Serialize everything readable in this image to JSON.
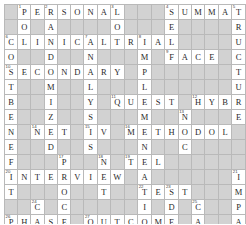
{
  "puzzle": {
    "type": "crossword-grid",
    "columns": 15,
    "rows": 15,
    "colors": {
      "empty_cell": "#d9d9d9",
      "letter_cell": "#ffffff",
      "grid_line": "#b9b9b9",
      "letter_text": "#2a2a2a",
      "number_text": "#3a3a3a"
    },
    "answers_across": [
      {
        "number": "1",
        "text": "PERSONAL",
        "row": 1,
        "col": 2
      },
      {
        "number": "4",
        "text": "SUMMAT",
        "row": 1,
        "col": 10
      },
      {
        "number": "6",
        "text": "CLINICALTRIAL",
        "row": 3,
        "col": 1
      },
      {
        "number": "7",
        "text": "FACE",
        "row": 4,
        "col": 11
      },
      {
        "number": "10",
        "text": "SECONDARY",
        "row": 5,
        "col": 1
      },
      {
        "number": "11",
        "text": "QUEST",
        "row": 7,
        "col": 8
      },
      {
        "number": "12",
        "text": "HYBR",
        "row": 7,
        "col": 12
      },
      {
        "number": "14",
        "text": "NET",
        "row": 9,
        "col": 3
      },
      {
        "number": "16",
        "text": "METHODOL",
        "row": 9,
        "col": 8
      },
      {
        "number": "18",
        "text": "TEL",
        "row": 11,
        "col": 10
      },
      {
        "number": "19",
        "text": "INTERVIEW",
        "row": 12,
        "col": 1
      },
      {
        "number": "22",
        "text": "TEST",
        "row": 13,
        "col": 10
      },
      {
        "number": "24",
        "text": "PHASE",
        "row": 15,
        "col": 1
      },
      {
        "number": "25",
        "text": "OUTCOME",
        "row": 15,
        "col": 7
      },
      {
        "number": "28",
        "text": "III",
        "row": 17,
        "col": 1
      },
      {
        "number": "29",
        "text": "SURVEY",
        "row": 17,
        "col": 5
      },
      {
        "number": "30",
        "text": "INDICAT",
        "row": 17,
        "col": 12
      }
    ],
    "grid": [
      [
        {
          "s": "block"
        },
        {
          "s": "open",
          "l": "P",
          "n": "1"
        },
        {
          "s": "open",
          "l": "E"
        },
        {
          "s": "open",
          "l": "R",
          "n": "2"
        },
        {
          "s": "open",
          "l": "S"
        },
        {
          "s": "open",
          "l": "O"
        },
        {
          "s": "open",
          "l": "N"
        },
        {
          "s": "open",
          "l": "A"
        },
        {
          "s": "open",
          "l": "L",
          "n": "3"
        },
        {
          "s": "block"
        },
        {
          "s": "block"
        },
        {
          "s": "block"
        },
        {
          "s": "open",
          "l": "S",
          "n": "4"
        },
        {
          "s": "open",
          "l": "U"
        },
        {
          "s": "open",
          "l": "M"
        },
        {
          "s": "open",
          "l": "M"
        },
        {
          "s": "open",
          "l": "A"
        },
        {
          "s": "open",
          "l": "T",
          "n": "5"
        }
      ],
      [
        {
          "s": "block"
        },
        {
          "s": "open",
          "l": "O"
        },
        {
          "s": "block"
        },
        {
          "s": "open",
          "l": "A"
        },
        {
          "s": "block"
        },
        {
          "s": "block"
        },
        {
          "s": "block"
        },
        {
          "s": "block"
        },
        {
          "s": "open",
          "l": "O"
        },
        {
          "s": "block"
        },
        {
          "s": "block"
        },
        {
          "s": "block"
        },
        {
          "s": "open",
          "l": "E"
        },
        {
          "s": "block"
        },
        {
          "s": "block"
        },
        {
          "s": "block"
        },
        {
          "s": "block"
        },
        {
          "s": "open",
          "l": "R"
        }
      ],
      [
        {
          "s": "open",
          "l": "C",
          "n": "6"
        },
        {
          "s": "open",
          "l": "L"
        },
        {
          "s": "open",
          "l": "I"
        },
        {
          "s": "open",
          "l": "N"
        },
        {
          "s": "open",
          "l": "I"
        },
        {
          "s": "open",
          "l": "C"
        },
        {
          "s": "open",
          "l": "A",
          "n": "7"
        },
        {
          "s": "open",
          "l": "L"
        },
        {
          "s": "open",
          "l": "T"
        },
        {
          "s": "open",
          "l": "R"
        },
        {
          "s": "open",
          "l": "I",
          "n": "8"
        },
        {
          "s": "open",
          "l": "A"
        },
        {
          "s": "open",
          "l": "L"
        },
        {
          "s": "block"
        },
        {
          "s": "block"
        },
        {
          "s": "block"
        },
        {
          "s": "block"
        },
        {
          "s": "open",
          "l": "U"
        }
      ],
      [
        {
          "s": "open",
          "l": "O"
        },
        {
          "s": "block"
        },
        {
          "s": "block"
        },
        {
          "s": "open",
          "l": "D"
        },
        {
          "s": "block"
        },
        {
          "s": "block"
        },
        {
          "s": "open",
          "l": "N"
        },
        {
          "s": "block"
        },
        {
          "s": "block"
        },
        {
          "s": "block"
        },
        {
          "s": "open",
          "l": "M"
        },
        {
          "s": "block"
        },
        {
          "s": "open",
          "l": "F",
          "n": "9"
        },
        {
          "s": "open",
          "l": "A"
        },
        {
          "s": "open",
          "l": "C"
        },
        {
          "s": "open",
          "l": "E"
        },
        {
          "s": "block"
        },
        {
          "s": "open",
          "l": "C"
        }
      ],
      [
        {
          "s": "open",
          "l": "S",
          "n": "10"
        },
        {
          "s": "open",
          "l": "E"
        },
        {
          "s": "open",
          "l": "C"
        },
        {
          "s": "open",
          "l": "O"
        },
        {
          "s": "open",
          "l": "N"
        },
        {
          "s": "open",
          "l": "D"
        },
        {
          "s": "open",
          "l": "A"
        },
        {
          "s": "open",
          "l": "R"
        },
        {
          "s": "open",
          "l": "Y"
        },
        {
          "s": "block"
        },
        {
          "s": "open",
          "l": "P"
        },
        {
          "s": "block"
        },
        {
          "s": "block"
        },
        {
          "s": "block"
        },
        {
          "s": "block"
        },
        {
          "s": "block"
        },
        {
          "s": "block"
        },
        {
          "s": "open",
          "l": "T"
        }
      ],
      [
        {
          "s": "open",
          "l": "T"
        },
        {
          "s": "block"
        },
        {
          "s": "block"
        },
        {
          "s": "open",
          "l": "M"
        },
        {
          "s": "block"
        },
        {
          "s": "block"
        },
        {
          "s": "open",
          "l": "L"
        },
        {
          "s": "block"
        },
        {
          "s": "block"
        },
        {
          "s": "block"
        },
        {
          "s": "open",
          "l": "L"
        },
        {
          "s": "block"
        },
        {
          "s": "block"
        },
        {
          "s": "block"
        },
        {
          "s": "block"
        },
        {
          "s": "block"
        },
        {
          "s": "block"
        },
        {
          "s": "open",
          "l": "U"
        }
      ],
      [
        {
          "s": "open",
          "l": "B"
        },
        {
          "s": "block"
        },
        {
          "s": "block"
        },
        {
          "s": "open",
          "l": "I"
        },
        {
          "s": "block"
        },
        {
          "s": "block"
        },
        {
          "s": "open",
          "l": "Y"
        },
        {
          "s": "block"
        },
        {
          "s": "open",
          "l": "Q",
          "n": "11"
        },
        {
          "s": "open",
          "l": "U"
        },
        {
          "s": "open",
          "l": "E"
        },
        {
          "s": "open",
          "l": "S"
        },
        {
          "s": "open",
          "l": "T"
        },
        {
          "s": "block"
        },
        {
          "s": "open",
          "l": "H",
          "n": "12"
        },
        {
          "s": "open",
          "l": "Y"
        },
        {
          "s": "open",
          "l": "B"
        },
        {
          "s": "open",
          "l": "R"
        }
      ],
      [
        {
          "s": "open",
          "l": "E"
        },
        {
          "s": "block"
        },
        {
          "s": "block"
        },
        {
          "s": "open",
          "l": "Z"
        },
        {
          "s": "block"
        },
        {
          "s": "block"
        },
        {
          "s": "open",
          "l": "S"
        },
        {
          "s": "block"
        },
        {
          "s": "block"
        },
        {
          "s": "block"
        },
        {
          "s": "open",
          "l": "M"
        },
        {
          "s": "block"
        },
        {
          "s": "block"
        },
        {
          "s": "open",
          "l": "N",
          "n": "13"
        },
        {
          "s": "block"
        },
        {
          "s": "block"
        },
        {
          "s": "block"
        },
        {
          "s": "open",
          "l": "E"
        }
      ],
      [
        {
          "s": "open",
          "l": "N"
        },
        {
          "s": "block"
        },
        {
          "s": "open",
          "l": "N",
          "n": "14"
        },
        {
          "s": "open",
          "l": "E"
        },
        {
          "s": "open",
          "l": "T"
        },
        {
          "s": "block"
        },
        {
          "s": "open",
          "l": "I",
          "n": "15"
        },
        {
          "s": "open",
          "l": "V"
        },
        {
          "s": "block"
        },
        {
          "s": "open",
          "l": "M",
          "n": "16"
        },
        {
          "s": "open",
          "l": "E"
        },
        {
          "s": "open",
          "l": "T"
        },
        {
          "s": "open",
          "l": "H"
        },
        {
          "s": "open",
          "l": "O"
        },
        {
          "s": "open",
          "l": "D"
        },
        {
          "s": "open",
          "l": "O"
        },
        {
          "s": "open",
          "l": "L"
        },
        {
          "s": "block"
        }
      ],
      [
        {
          "s": "open",
          "l": "E"
        },
        {
          "s": "block"
        },
        {
          "s": "block"
        },
        {
          "s": "open",
          "l": "D"
        },
        {
          "s": "block"
        },
        {
          "s": "block"
        },
        {
          "s": "open",
          "l": "S"
        },
        {
          "s": "block"
        },
        {
          "s": "block"
        },
        {
          "s": "block"
        },
        {
          "s": "open",
          "l": "N"
        },
        {
          "s": "block"
        },
        {
          "s": "block"
        },
        {
          "s": "open",
          "l": "C"
        },
        {
          "s": "block"
        },
        {
          "s": "block"
        },
        {
          "s": "block"
        },
        {
          "s": "block"
        }
      ],
      [
        {
          "s": "open",
          "l": "F"
        },
        {
          "s": "block"
        },
        {
          "s": "block"
        },
        {
          "s": "block"
        },
        {
          "s": "open",
          "l": "P",
          "n": "17"
        },
        {
          "s": "block"
        },
        {
          "s": "block"
        },
        {
          "s": "open",
          "l": "N",
          "n": "18"
        },
        {
          "s": "block"
        },
        {
          "s": "open",
          "l": "T",
          "n": "19"
        },
        {
          "s": "open",
          "l": "E"
        },
        {
          "s": "open",
          "l": "L"
        },
        {
          "s": "block"
        },
        {
          "s": "block"
        },
        {
          "s": "block"
        },
        {
          "s": "block"
        },
        {
          "s": "block"
        },
        {
          "s": "block"
        }
      ],
      [
        {
          "s": "open",
          "l": "I",
          "n": "20"
        },
        {
          "s": "open",
          "l": "N"
        },
        {
          "s": "open",
          "l": "T"
        },
        {
          "s": "open",
          "l": "E"
        },
        {
          "s": "open",
          "l": "R"
        },
        {
          "s": "open",
          "l": "V"
        },
        {
          "s": "open",
          "l": "I"
        },
        {
          "s": "open",
          "l": "E"
        },
        {
          "s": "open",
          "l": "W"
        },
        {
          "s": "block"
        },
        {
          "s": "open",
          "l": "A"
        },
        {
          "s": "block"
        },
        {
          "s": "block"
        },
        {
          "s": "block"
        },
        {
          "s": "block"
        },
        {
          "s": "block"
        },
        {
          "s": "block"
        },
        {
          "s": "open",
          "l": "I",
          "n": "21"
        }
      ],
      [
        {
          "s": "open",
          "l": "T"
        },
        {
          "s": "block"
        },
        {
          "s": "block"
        },
        {
          "s": "block"
        },
        {
          "s": "open",
          "l": "O"
        },
        {
          "s": "block"
        },
        {
          "s": "block"
        },
        {
          "s": "open",
          "l": "T"
        },
        {
          "s": "block"
        },
        {
          "s": "block"
        },
        {
          "s": "open",
          "l": "T",
          "n": "22"
        },
        {
          "s": "open",
          "l": "E"
        },
        {
          "s": "open",
          "l": "S",
          "n": "23"
        },
        {
          "s": "open",
          "l": "T"
        },
        {
          "s": "block"
        },
        {
          "s": "block"
        },
        {
          "s": "block"
        },
        {
          "s": "open",
          "l": "M"
        }
      ],
      [
        {
          "s": "block"
        },
        {
          "s": "block"
        },
        {
          "s": "open",
          "l": "C",
          "n": "24"
        },
        {
          "s": "block"
        },
        {
          "s": "open",
          "l": "C"
        },
        {
          "s": "block"
        },
        {
          "s": "block"
        },
        {
          "s": "block"
        },
        {
          "s": "block"
        },
        {
          "s": "block"
        },
        {
          "s": "open",
          "l": "I"
        },
        {
          "s": "block"
        },
        {
          "s": "open",
          "l": "D"
        },
        {
          "s": "block"
        },
        {
          "s": "open",
          "l": "C",
          "n": "25"
        },
        {
          "s": "block"
        },
        {
          "s": "block"
        },
        {
          "s": "open",
          "l": "P"
        }
      ],
      [
        {
          "s": "open",
          "l": "P",
          "n": "26"
        },
        {
          "s": "open",
          "l": "H"
        },
        {
          "s": "open",
          "l": "A"
        },
        {
          "s": "open",
          "l": "S"
        },
        {
          "s": "open",
          "l": "E"
        },
        {
          "s": "block"
        },
        {
          "s": "open",
          "l": "O",
          "n": "27"
        },
        {
          "s": "open",
          "l": "U"
        },
        {
          "s": "open",
          "l": "T"
        },
        {
          "s": "open",
          "l": "C"
        },
        {
          "s": "open",
          "l": "O"
        },
        {
          "s": "open",
          "l": "M"
        },
        {
          "s": "open",
          "l": "E"
        },
        {
          "s": "block"
        },
        {
          "s": "open",
          "l": "A"
        },
        {
          "s": "block"
        },
        {
          "s": "block"
        },
        {
          "s": "open",
          "l": "A"
        }
      ],
      [
        {
          "s": "open",
          "l": "H"
        },
        {
          "s": "block"
        },
        {
          "s": "open",
          "l": "S"
        },
        {
          "s": "block"
        },
        {
          "s": "open",
          "l": "S"
        },
        {
          "s": "block"
        },
        {
          "s": "block"
        },
        {
          "s": "block"
        },
        {
          "s": "block"
        },
        {
          "s": "block"
        },
        {
          "s": "open",
          "l": "N"
        },
        {
          "s": "block"
        },
        {
          "s": "open",
          "l": "E"
        },
        {
          "s": "block"
        },
        {
          "s": "open",
          "l": "T"
        },
        {
          "s": "block"
        },
        {
          "s": "block"
        },
        {
          "s": "open",
          "l": "C"
        }
      ],
      [
        {
          "s": "open",
          "l": "I",
          "n": "28"
        },
        {
          "s": "open",
          "l": "I"
        },
        {
          "s": "open",
          "l": "I"
        },
        {
          "s": "block"
        },
        {
          "s": "open",
          "l": "S",
          "n": "29"
        },
        {
          "s": "open",
          "l": "U"
        },
        {
          "s": "open",
          "l": "R"
        },
        {
          "s": "open",
          "l": "V"
        },
        {
          "s": "open",
          "l": "E"
        },
        {
          "s": "open",
          "l": "Y"
        },
        {
          "s": "block"
        },
        {
          "s": "open",
          "l": "I",
          "n": "30"
        },
        {
          "s": "open",
          "l": "N"
        },
        {
          "s": "open",
          "l": "D"
        },
        {
          "s": "open",
          "l": "I"
        },
        {
          "s": "open",
          "l": "C"
        },
        {
          "s": "open",
          "l": "A"
        },
        {
          "s": "open",
          "l": "T"
        }
      ]
    ]
  }
}
